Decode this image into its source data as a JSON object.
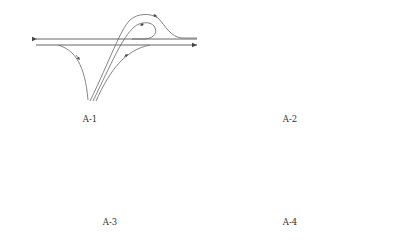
{
  "figure": {
    "panels": [
      {
        "id": "A-1",
        "label": "A-1",
        "description": "Mainline with loop ramp and diagonal ramps (trumpet-like interchange)"
      },
      {
        "id": "A-2",
        "label": "A-2",
        "description": "Mainline with left loop, dashed alternate ramp, and right loop ramp"
      },
      {
        "id": "A-3",
        "label": "A-3",
        "description": "Mainline with compact loop ramp on left and curved diverge on right"
      },
      {
        "id": "A-4",
        "label": "A-4",
        "description": "Mainline with circular loop on left and crossing ramps with overpass marks on right"
      }
    ],
    "colors": {
      "line": "#555555",
      "background": "#ffffff",
      "label": "#333333"
    },
    "legend": {
      "solid_line": "ramp / roadway",
      "dashed_line": "alternate ramp",
      "arrow": "direction of travel"
    }
  }
}
